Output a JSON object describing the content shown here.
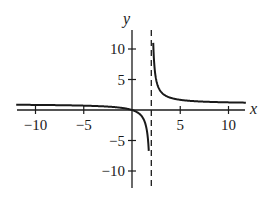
{
  "chart_data": {
    "type": "line",
    "title": "",
    "function": "y = x/(x-2)",
    "xlabel": "x",
    "ylabel": "y",
    "xlim": [
      -12,
      12
    ],
    "ylim": [
      -13,
      13
    ],
    "grid": false,
    "x_ticks": [
      -10,
      -5,
      5,
      10
    ],
    "x_tick_labels": [
      "−10",
      "−5",
      "5",
      "10"
    ],
    "y_ticks": [
      10,
      5,
      -5,
      -10
    ],
    "y_tick_labels": [
      "10",
      "5",
      "−5",
      "−10"
    ],
    "vertical_asymptote": {
      "x": 2,
      "style": "dashed"
    },
    "horizontal_asymptote": {
      "y": 1
    },
    "series": [
      {
        "name": "left branch",
        "x": [
          -12,
          -10,
          -5,
          -2,
          0,
          1,
          1.5,
          1.8
        ],
        "y": [
          0.86,
          0.83,
          0.71,
          0.5,
          0,
          -1,
          -3,
          -9
        ]
      },
      {
        "name": "right branch",
        "x": [
          2.15,
          2.5,
          3,
          4,
          5,
          7,
          10,
          12
        ],
        "y": [
          14.3,
          5,
          3,
          2,
          1.67,
          1.4,
          1.25,
          1.2
        ]
      }
    ],
    "colors": {
      "curve": "#1a1a1a",
      "axes": "#1a1a1a",
      "asymptote": "#1a1a1a"
    }
  }
}
